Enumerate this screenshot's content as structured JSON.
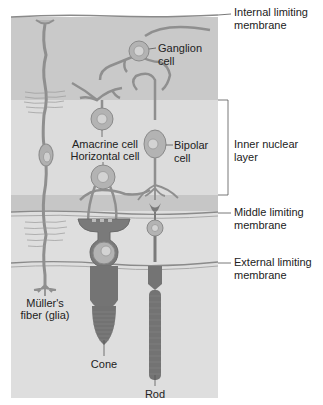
{
  "diagram": {
    "type": "retina-layers",
    "colors": {
      "ganglion_layer": "#c9c9c9",
      "inner_nuclear_layer": "#dcdcdc",
      "outer_plexiform_layer": "#c6c6c6",
      "outer_layer": "#dedede",
      "cell_fill": "#a9a9a9",
      "cell_stroke": "#8a8a8a",
      "photoreceptor": "#737373",
      "membrane_line": "#7a7a7a",
      "text": "#222222"
    },
    "membranes": [
      {
        "id": "internal",
        "line1": "Internal limiting",
        "line2": "membrane"
      },
      {
        "id": "middle",
        "line1": "Middle limiting",
        "line2": "membrane"
      },
      {
        "id": "external",
        "line1": "External limiting",
        "line2": "membrane"
      }
    ],
    "layers": [
      {
        "id": "inner-nuclear",
        "line1": "Inner nuclear",
        "line2": "layer"
      }
    ],
    "cells": {
      "ganglion": {
        "line1": "Ganglion",
        "line2": "cell"
      },
      "amacrine": {
        "label": "Amacrine cell"
      },
      "horizontal": {
        "label": "Horizontal cell"
      },
      "bipolar": {
        "line1": "Bipolar",
        "line2": "cell"
      },
      "muller": {
        "line1": "Müller's",
        "line2": "fiber (glia)"
      },
      "cone": {
        "label": "Cone"
      },
      "rod": {
        "label": "Rod"
      }
    }
  }
}
